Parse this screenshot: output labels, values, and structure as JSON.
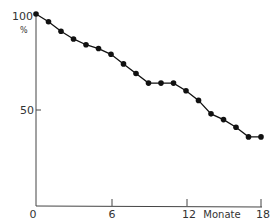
{
  "chart_data": {
    "type": "line",
    "title": "",
    "xlabel": "Monate",
    "ylabel": "%",
    "xlim": [
      0,
      18
    ],
    "ylim": [
      0,
      100
    ],
    "x_ticks": [
      "0",
      "6",
      "12",
      "18"
    ],
    "y_ticks": [
      "50",
      "100"
    ],
    "grid": false,
    "legend": null,
    "x": [
      0,
      1,
      2,
      3,
      4,
      5,
      6,
      7,
      8,
      9,
      10,
      11,
      12,
      13,
      14,
      15,
      16,
      17,
      18
    ],
    "series": [
      {
        "name": "Verlauf",
        "values": [
          100,
          96,
          91,
          87,
          84,
          82,
          79,
          74,
          69,
          64,
          64,
          64,
          60,
          55,
          48,
          45,
          41,
          36,
          36
        ]
      }
    ]
  },
  "labels": {
    "y_top": "100",
    "y_unit": "%",
    "y_mid": "50",
    "x_zero": "0",
    "x_6": "6",
    "x_12": "12",
    "x_unit": "Monate",
    "x_18": "18"
  }
}
